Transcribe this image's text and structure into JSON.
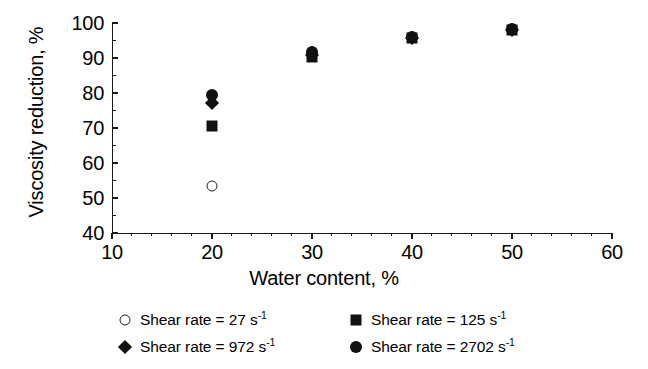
{
  "chart_data": {
    "type": "scatter",
    "title": "",
    "xlabel": "Water content, %",
    "ylabel": "Viscosity reduction, %",
    "xlim": [
      10,
      60
    ],
    "ylim": [
      40,
      100
    ],
    "xticks": [
      10,
      20,
      30,
      40,
      50,
      60
    ],
    "yticks": [
      40,
      50,
      60,
      70,
      80,
      90,
      100
    ],
    "x_minor_step": 2,
    "y_minor_step": 5,
    "grid": false,
    "legend_position": "below-plot",
    "series": [
      {
        "name": "Shear rate = 27 s-1",
        "label_prefix": "Shear rate = ",
        "value": "27",
        "unit": "s",
        "exponent": "-1",
        "marker": "circle-open",
        "x": [
          20
        ],
        "values": [
          53.4
        ]
      },
      {
        "name": "Shear rate = 125 s-1",
        "label_prefix": "Shear rate = ",
        "value": "125",
        "unit": "s",
        "exponent": "-1",
        "marker": "square-filled",
        "x": [
          20,
          30,
          40,
          50
        ],
        "values": [
          70.6,
          90.3,
          95.6,
          98.0
        ]
      },
      {
        "name": "Shear rate = 972 s-1",
        "label_prefix": "Shear rate = ",
        "value": "972",
        "unit": "s",
        "exponent": "-1",
        "marker": "diamond-filled",
        "x": [
          20,
          30,
          40,
          50
        ],
        "values": [
          77.2,
          91.0,
          95.6,
          98.1
        ]
      },
      {
        "name": "Shear rate = 2702 s-1",
        "label_prefix": "Shear rate = ",
        "value": "2702",
        "unit": "s",
        "exponent": "-1",
        "marker": "circle-filled",
        "x": [
          20,
          30,
          40,
          50
        ],
        "values": [
          79.3,
          91.6,
          95.9,
          98.2
        ]
      }
    ]
  },
  "axis": {
    "xlabel": "Water content, %",
    "ylabel": "Viscosity reduction, %",
    "xtick_labels": [
      "10",
      "20",
      "30",
      "40",
      "50",
      "60"
    ],
    "ytick_labels": [
      "40",
      "50",
      "60",
      "70",
      "80",
      "90",
      "100"
    ]
  },
  "legend": {
    "entries": [
      {
        "marker": "circle-open",
        "text": "Shear rate = 27 s",
        "exp": "-1"
      },
      {
        "marker": "square-filled",
        "text": "Shear rate = 125 s",
        "exp": "-1"
      },
      {
        "marker": "diamond-filled",
        "text": "Shear rate = 972 s",
        "exp": "-1"
      },
      {
        "marker": "circle-filled",
        "text": "Shear rate = 2702 s",
        "exp": "-1"
      }
    ]
  },
  "colors": {
    "ink": "#111111",
    "axis": "#1a1a1a",
    "background": "#ffffff"
  }
}
